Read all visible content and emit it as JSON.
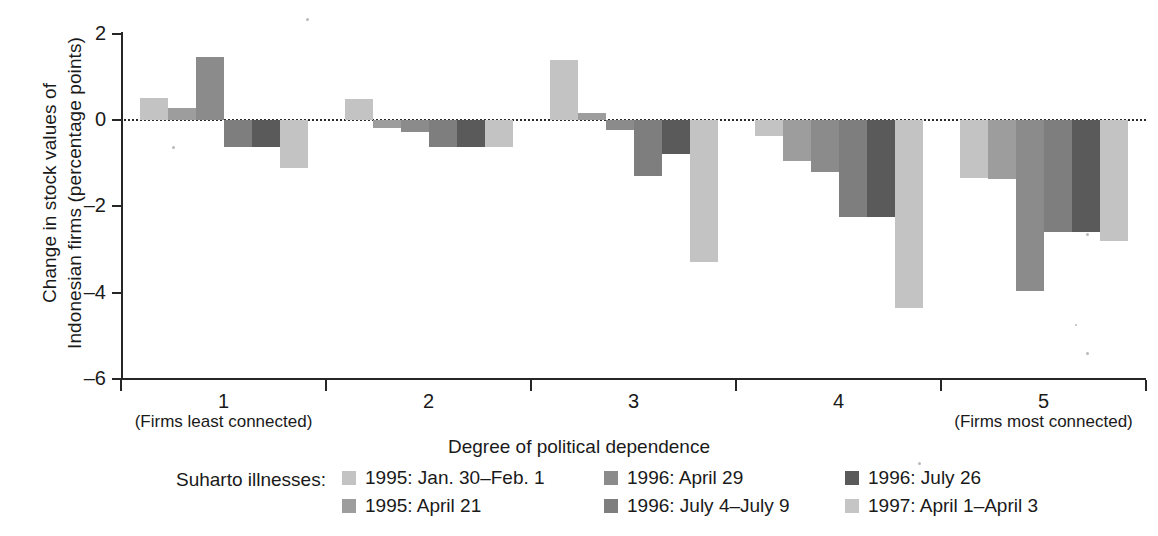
{
  "chart_data": {
    "type": "bar",
    "title": "",
    "xlabel": "Degree of political dependence",
    "ylabel": "Change in stock values of\nIndonesian firms (percentage points)",
    "ylim": [
      -6,
      2
    ],
    "yticks": [
      2,
      0,
      -2,
      -4,
      -6
    ],
    "ytick_labels": [
      "2",
      "0",
      "–2",
      "–4",
      "–6"
    ],
    "grid": false,
    "zero_line": true,
    "legend_position": "bottom",
    "categories": [
      "1",
      "2",
      "3",
      "4",
      "5"
    ],
    "category_sublabels": [
      "(Firms least connected)",
      "",
      "",
      "",
      "(Firms most connected)"
    ],
    "series": [
      {
        "name": "1995: Jan. 30–Feb. 1",
        "color": "#c3c3c3",
        "values": [
          0.5,
          0.48,
          1.4,
          -0.38,
          -1.35
        ]
      },
      {
        "name": "1995: April 21",
        "color": "#9d9d9d",
        "values": [
          0.27,
          -0.18,
          0.17,
          -0.95,
          -1.37
        ]
      },
      {
        "name": "1996: April 29",
        "color": "#8b8b8b",
        "values": [
          1.45,
          -0.28,
          -0.23,
          -1.2,
          -3.95
        ]
      },
      {
        "name": "1996: July 4–July 9",
        "color": "#7e7e7e",
        "values": [
          -0.62,
          -0.62,
          -1.3,
          -2.25,
          -2.6
        ]
      },
      {
        "name": "1996: July 26",
        "color": "#5a5a5a",
        "values": [
          -0.62,
          -0.62,
          -0.78,
          -2.25,
          -2.6
        ]
      },
      {
        "name": "1997: April 1–April 3",
        "color": "#c3c3c3",
        "values": [
          -1.12,
          -0.62,
          -3.3,
          -4.35,
          -2.8
        ]
      }
    ]
  },
  "axis": {
    "y_title": "Change in stock values of\nIndonesian firms (percentage points)",
    "x_title": "Degree of political dependence",
    "y_tick_labels": [
      "2",
      "0",
      "–2",
      "–4",
      "–6"
    ],
    "x_tick_labels": [
      "1",
      "2",
      "3",
      "4",
      "5"
    ],
    "x_sub_left": "(Firms least connected)",
    "x_sub_right": "(Firms most connected)"
  },
  "legend": {
    "title": "Suharto illnesses:",
    "items": [
      {
        "label": "1995: Jan. 30–Feb. 1",
        "color": "#c3c3c3"
      },
      {
        "label": "1995: April 21",
        "color": "#9d9d9d"
      },
      {
        "label": "1996: April 29",
        "color": "#8b8b8b"
      },
      {
        "label": "1996: July 4–July 9",
        "color": "#7e7e7e"
      },
      {
        "label": "1996: July 26",
        "color": "#5a5a5a"
      },
      {
        "label": "1997: April 1–April 3",
        "color": "#c5c5c5"
      }
    ]
  },
  "colors": {
    "axis": "#262626",
    "background": "#ffffff",
    "text": "#1a1a1a"
  }
}
